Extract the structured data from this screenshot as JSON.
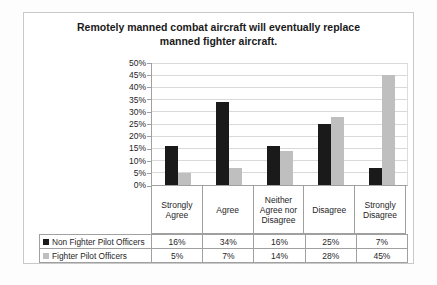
{
  "chart_data": {
    "type": "bar",
    "title": "Remotely manned combat aircraft will eventually replace manned fighter aircraft.",
    "categories": [
      "Strongly Agree",
      "Agree",
      "Neither Agree nor Disagree",
      "Disagree",
      "Strongly Disagree"
    ],
    "series": [
      {
        "name": "Non Fighter Pilot Officers",
        "color": "#1a1a1a",
        "values": [
          16,
          34,
          16,
          25,
          7
        ]
      },
      {
        "name": "Fighter Pilot Officers",
        "color": "#bfbfbf",
        "values": [
          5,
          7,
          14,
          28,
          45
        ]
      }
    ],
    "ylim": [
      0,
      50
    ],
    "ytick_step": 5,
    "value_suffix": "%",
    "grid": true,
    "legend_position": "data-table-left",
    "data_table": true,
    "gridline_color": "#d9d9d9",
    "axis_color": "#a0a0a0"
  }
}
